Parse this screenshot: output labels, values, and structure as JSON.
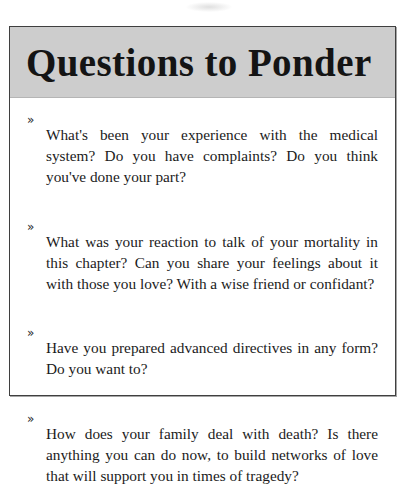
{
  "page": {
    "background_color": "#ffffff",
    "artifact": "scan-smudge"
  },
  "callout": {
    "title": "Questions to Ponder",
    "header_background": "#cdcdcd",
    "border_color": "#3f3f3f",
    "text_color": "#1b1b1b",
    "bullet_glyph": "»",
    "bullet_icon_name": "arrow-bullet-icon",
    "questions": [
      {
        "id": "q1",
        "text": "What's been your experience with the medical system? Do you have complaints? Do you think you've done your part?"
      },
      {
        "id": "q2",
        "text": "What was your reaction to talk of your mortality in this chapter? Can you share your feelings about it with those you love? With a wise friend or confidant?"
      },
      {
        "id": "q3",
        "text": "Have you prepared advanced directives in any form? Do you want to?"
      },
      {
        "id": "q4",
        "text": "How does your family deal with death? Is there anything you can do now, to build networks of love that will support you in times of tragedy?"
      }
    ]
  }
}
